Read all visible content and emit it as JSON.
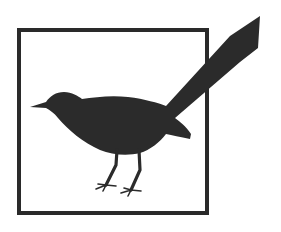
{
  "logo": {
    "description": "Bird silhouette with long tail inside square frame",
    "icon": "bird-silhouette-icon",
    "colors": {
      "background": "#ffffff",
      "frame": "#2a2a2a",
      "bird": "#2b2b2b"
    }
  }
}
